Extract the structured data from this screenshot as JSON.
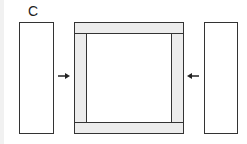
{
  "diagram": {
    "label": "C",
    "colors": {
      "stroke": "#333333",
      "bar_fill": "#ececec",
      "panel_fill": "#ffffff"
    },
    "elements": {
      "left_panel": "left-panel",
      "right_panel": "right-panel",
      "frame": [
        "top-bar",
        "bottom-bar",
        "left-side-bar",
        "right-side-bar"
      ],
      "arrows": [
        "arrow-right-pointing-to-frame",
        "arrow-left-pointing-to-frame"
      ]
    }
  }
}
